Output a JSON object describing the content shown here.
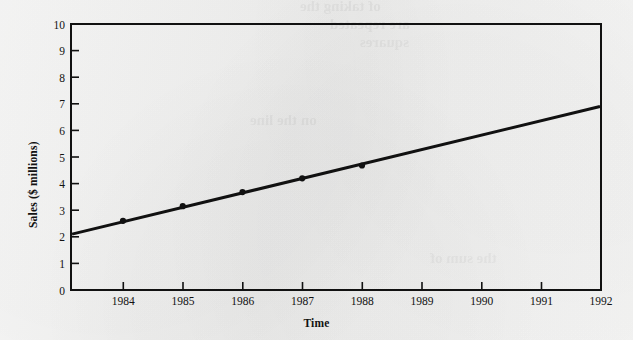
{
  "figure": {
    "background_color": "#f1f1f0",
    "ink_color": "#111111"
  },
  "chart_data": {
    "type": "line",
    "title": "",
    "xlabel": "Time",
    "ylabel": "Sales ($ millions)",
    "x": [
      1984,
      1985,
      1986,
      1987,
      1988
    ],
    "values": [
      2.6,
      3.15,
      3.68,
      4.2,
      4.68
    ],
    "series": [
      {
        "name": "Sales",
        "x": [
          1984,
          1985,
          1986,
          1987,
          1988
        ],
        "values": [
          2.6,
          3.15,
          3.68,
          4.2,
          4.68
        ],
        "marker": "filled-circle",
        "line_color": "#111111",
        "line_width": 3
      }
    ],
    "trend_line": {
      "description": "straight line extending across the full plot from the left edge through the data points to the right edge",
      "x_start": 1983.13,
      "y_start": 2.1,
      "x_end": 1992,
      "y_end": 6.9
    },
    "xlim": [
      1983.13,
      1992
    ],
    "ylim": [
      0,
      10
    ],
    "xticks": [
      1984,
      1985,
      1986,
      1987,
      1988,
      1989,
      1990,
      1991,
      1992
    ],
    "xticklabels": [
      "1984",
      "1985",
      "1986",
      "1987",
      "1988",
      "1989",
      "1990",
      "1991",
      "1992"
    ],
    "yticks": [
      0,
      1,
      2,
      3,
      4,
      5,
      6,
      7,
      8,
      9,
      10
    ],
    "yticklabels": [
      "0",
      "1",
      "2",
      "3",
      "4",
      "5",
      "6",
      "7",
      "8",
      "9",
      "10"
    ],
    "grid": false,
    "legend": null,
    "frame": "full-box"
  },
  "bleed_through": {
    "lines": [
      "of taking the",
      "are repeated",
      "squares",
      "on the line",
      "the sum of"
    ]
  }
}
